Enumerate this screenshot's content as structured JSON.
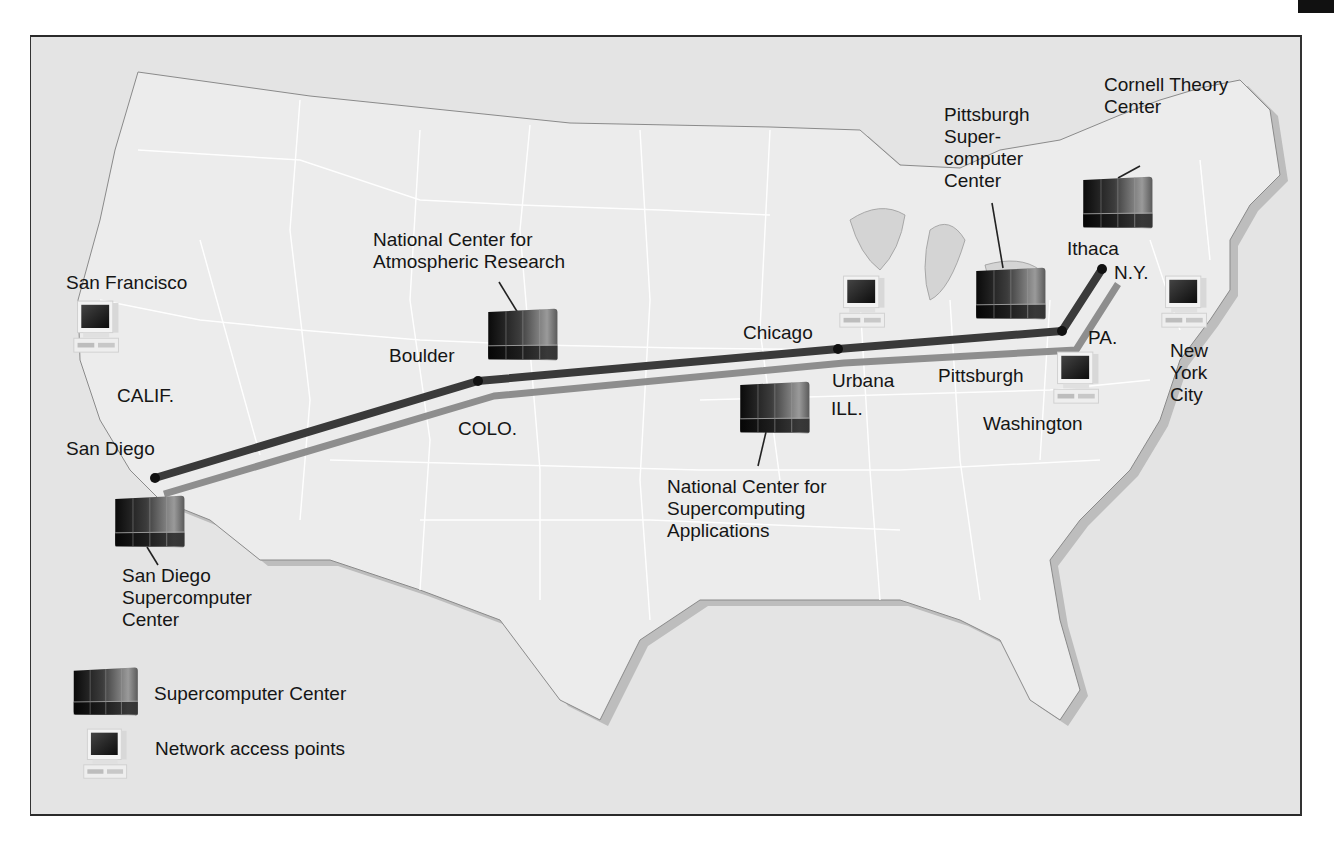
{
  "figure": {
    "type": "network-map"
  },
  "colors": {
    "background": "#e4e4e4",
    "land": "#ececec",
    "land_shadow": "#bdbdbd",
    "state_border": "#ffffff",
    "backbone_primary": "#3a3a3a",
    "backbone_secondary": "#8e8e8e",
    "node": "#111111"
  },
  "labels": {
    "san_francisco": "San Francisco",
    "calif": "CALIF.",
    "san_diego": "San Diego",
    "sdsc": [
      "San Diego",
      "Supercomputer",
      "Center"
    ],
    "ncar": [
      "National Center for",
      "Atmospheric Research"
    ],
    "boulder": "Boulder",
    "colo": "COLO.",
    "chicago": "Chicago",
    "urbana": "Urbana",
    "ill": "ILL.",
    "ncsa": [
      "National Center for",
      "Supercomputing",
      "Applications"
    ],
    "psc": [
      "Pittsburgh",
      "Super-",
      "computer",
      "Center"
    ],
    "pittsburgh": "Pittsburgh",
    "pa": "PA.",
    "washington": "Washington",
    "cornell": [
      "Cornell Theory",
      "Center"
    ],
    "ithaca": "Ithaca",
    "ny": "N.Y.",
    "nyc": [
      "New",
      "York",
      "City"
    ]
  },
  "supercomputer_centers": [
    {
      "name": "San Diego Supercomputer Center",
      "icon": "supercomputer-icon"
    },
    {
      "name": "National Center for Atmospheric Research",
      "icon": "supercomputer-icon"
    },
    {
      "name": "National Center for Supercomputing Applications",
      "icon": "supercomputer-icon"
    },
    {
      "name": "Pittsburgh Supercomputer Center",
      "icon": "supercomputer-icon"
    },
    {
      "name": "Cornell Theory Center",
      "icon": "supercomputer-icon"
    }
  ],
  "network_access_points": [
    {
      "name": "San Francisco",
      "icon": "workstation-icon"
    },
    {
      "name": "Chicago",
      "icon": "workstation-icon"
    },
    {
      "name": "Washington",
      "icon": "workstation-icon"
    },
    {
      "name": "New York City",
      "icon": "workstation-icon"
    }
  ],
  "backbone_nodes": [
    "San Diego",
    "Boulder",
    "Chicago",
    "Pittsburgh",
    "Ithaca"
  ],
  "legend": {
    "supercomputer": "Supercomputer Center",
    "access_point": "Network access points"
  }
}
